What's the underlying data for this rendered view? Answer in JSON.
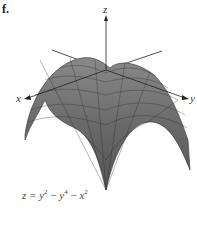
{
  "figure": {
    "panel_label": "f.",
    "axes": {
      "x": "x",
      "y": "y",
      "z": "z"
    },
    "equation": {
      "lhs": "z",
      "rhs_terms": [
        {
          "var": "y",
          "exp": "2",
          "sign": ""
        },
        {
          "var": "y",
          "exp": "4",
          "sign": "−"
        },
        {
          "var": "x",
          "exp": "2",
          "sign": "−"
        }
      ]
    },
    "colors": {
      "surface": "#6e6e6e",
      "mesh": "#2a2a2a",
      "axis": "#222222"
    }
  }
}
